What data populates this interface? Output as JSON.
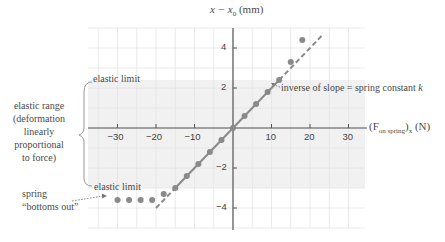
{
  "chart_data": {
    "type": "scatter",
    "title": "",
    "xlabel": "(F_on spring)_x (N)",
    "ylabel": "x − x₀ (mm)",
    "xlim": [
      -37,
      35
    ],
    "ylim": [
      -5,
      5
    ],
    "x_ticks": [
      -30,
      -20,
      -10,
      10,
      20,
      30
    ],
    "y_ticks": [
      -4,
      -2,
      2,
      4
    ],
    "grid": true,
    "grid_minor_x": 5,
    "grid_minor_y": 1,
    "shaded_band": {
      "y_top": 2.4,
      "y_bottom": -3.0,
      "label": "elastic range"
    },
    "fit_line": {
      "slope": 0.2,
      "intercept": 0,
      "style": "dashed",
      "x_range": [
        -20,
        23
      ]
    },
    "series": [
      {
        "name": "measurements",
        "points": [
          [
            -15,
            -3.0
          ],
          [
            -12,
            -2.4
          ],
          [
            -9,
            -1.8
          ],
          [
            -6,
            -1.2
          ],
          [
            -3,
            -0.6
          ],
          [
            0,
            0
          ],
          [
            3,
            0.6
          ],
          [
            6,
            1.2
          ],
          [
            9,
            1.8
          ],
          [
            12,
            2.4
          ],
          [
            15,
            3.3
          ],
          [
            18,
            4.4
          ],
          [
            -18,
            -3.3
          ],
          [
            -21,
            -3.6
          ],
          [
            -24,
            -3.6
          ],
          [
            -27,
            -3.6
          ],
          [
            -30,
            -3.6
          ]
        ]
      }
    ],
    "annotations": [
      "elastic limit",
      "elastic limit",
      "inverse of slope = spring constant k",
      "elastic range (deformation linearly proportional to force)",
      "spring \"bottoms out\""
    ]
  },
  "labels": {
    "y_axis": "x − x",
    "y_axis_sub": "0",
    "y_axis_unit": " (mm)",
    "x_axis_pre": "(F",
    "x_axis_sub": "on spring",
    "x_axis_post": ")",
    "x_axis_sub2": "x",
    "x_axis_unit": " (N)",
    "elastic_limit_top": "elastic limit",
    "elastic_limit_bottom": "elastic limit",
    "slope_note": "inverse of slope = spring constant ",
    "slope_note_k": "k",
    "range_line1": "elastic range",
    "range_line2": "(deformation",
    "range_line3": "linearly",
    "range_line4": "proportional",
    "range_line5": "to force)",
    "spring_line1": "spring",
    "spring_line2": "“bottoms out”"
  },
  "colors": {
    "grid": "#e4e4e4",
    "band": "#f1f1f1",
    "axis": "#555555",
    "points": "#8a8a8a",
    "line": "#8a8a8a",
    "text": "#4a4a4a"
  }
}
